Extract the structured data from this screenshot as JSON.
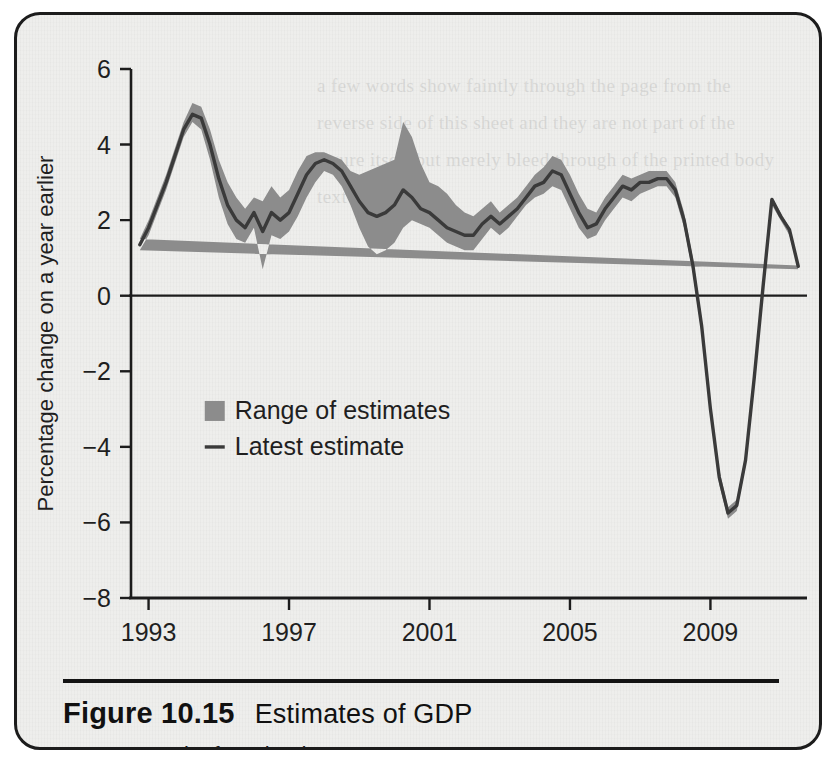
{
  "figure": {
    "number": "Figure 10.15",
    "title": "Estimates of GDP",
    "source_label": "Source:",
    "source_value": "Bank of England."
  },
  "colors": {
    "band": "#8c8c8c",
    "line": "#3a3a3a",
    "axis": "#1c1c1c",
    "paper": "#eeeeec",
    "border": "#1c1c1c"
  },
  "ghost_text": "a few words show faintly through the page from the reverse side of this sheet and they are not part of the figure itself but merely bleed through of the printed body text behind",
  "chart_data": {
    "type": "area",
    "title": "Estimates of GDP",
    "xlabel": "",
    "ylabel": "Percentage change on a year earlier",
    "xlim": [
      1992.5,
      2011.75
    ],
    "ylim": [
      -8,
      6
    ],
    "yticks": [
      6,
      4,
      2,
      0,
      -2,
      -4,
      -6,
      -8
    ],
    "ytick_labels": [
      "6",
      "4",
      "2",
      "0",
      "−2",
      "−4",
      "−6",
      "−8"
    ],
    "xticks": [
      1993,
      1997,
      2001,
      2005,
      2009
    ],
    "xtick_labels": [
      "1993",
      "1997",
      "2001",
      "2005",
      "2009"
    ],
    "grid": false,
    "zero_line": true,
    "legend": {
      "position": "inside-left",
      "entries": [
        {
          "label": "Range of estimates",
          "marker": "filled-square",
          "color": "#8c8c8c"
        },
        {
          "label": "Latest estimate",
          "marker": "line",
          "color": "#3a3a3a"
        }
      ]
    },
    "x": [
      1992.75,
      1993.0,
      1993.25,
      1993.5,
      1993.75,
      1994.0,
      1994.25,
      1994.5,
      1994.75,
      1995.0,
      1995.25,
      1995.5,
      1995.75,
      1996.0,
      1996.25,
      1996.5,
      1996.75,
      1997.0,
      1997.25,
      1997.5,
      1997.75,
      1998.0,
      1998.25,
      1998.5,
      1998.75,
      1999.0,
      1999.25,
      1999.5,
      1999.75,
      2000.0,
      2000.25,
      2000.5,
      2000.75,
      2001.0,
      2001.25,
      2001.5,
      2001.75,
      2002.0,
      2002.25,
      2002.5,
      2002.75,
      2003.0,
      2003.25,
      2003.5,
      2003.75,
      2004.0,
      2004.25,
      2004.5,
      2004.75,
      2005.0,
      2005.25,
      2005.5,
      2005.75,
      2006.0,
      2006.25,
      2006.5,
      2006.75,
      2007.0,
      2007.25,
      2007.5,
      2007.75,
      2008.0,
      2008.25,
      2008.5,
      2008.75,
      2009.0,
      2009.25,
      2009.5,
      2009.75,
      2010.0,
      2010.25,
      2010.5,
      2010.75,
      2011.0,
      2011.25,
      2011.5
    ],
    "series": [
      {
        "name": "Range of estimates (upper)",
        "role": "band-upper",
        "values": [
          1.5,
          2.0,
          2.6,
          3.2,
          3.9,
          4.6,
          5.1,
          5.0,
          4.4,
          3.6,
          3.0,
          2.6,
          2.3,
          2.6,
          2.5,
          2.9,
          2.6,
          2.8,
          3.3,
          3.7,
          3.8,
          3.8,
          3.7,
          3.6,
          3.3,
          3.2,
          3.3,
          3.4,
          3.5,
          3.6,
          4.6,
          4.2,
          3.5,
          3.0,
          2.9,
          2.7,
          2.4,
          2.2,
          2.1,
          2.3,
          2.5,
          2.2,
          2.4,
          2.6,
          2.9,
          3.2,
          3.4,
          3.7,
          3.6,
          3.2,
          2.7,
          2.3,
          2.2,
          2.6,
          2.9,
          3.2,
          3.1,
          3.2,
          3.3,
          3.3,
          3.3,
          3.0,
          2.2,
          1.0,
          -0.6,
          -2.8,
          -4.6,
          -5.6,
          -5.4,
          -4.2,
          -2.0,
          0.4,
          2.6,
          2.2,
          1.8,
          0.8
        ]
      },
      {
        "name": "Range of estimates (lower)",
        "role": "band-lower",
        "values": [
          1.2,
          1.6,
          2.2,
          2.8,
          3.5,
          4.2,
          4.6,
          4.4,
          3.6,
          2.6,
          1.9,
          1.5,
          1.4,
          1.8,
          0.7,
          1.6,
          1.5,
          1.7,
          2.1,
          2.6,
          3.0,
          3.3,
          3.2,
          2.9,
          2.4,
          1.8,
          1.3,
          1.1,
          1.2,
          1.4,
          1.8,
          2.0,
          1.9,
          1.8,
          1.6,
          1.4,
          1.3,
          1.2,
          1.2,
          1.5,
          1.8,
          1.6,
          1.8,
          2.1,
          2.4,
          2.6,
          2.7,
          2.9,
          2.8,
          2.3,
          1.8,
          1.5,
          1.6,
          2.0,
          2.3,
          2.6,
          2.5,
          2.7,
          2.8,
          2.9,
          2.9,
          2.6,
          1.8,
          0.6,
          -1.0,
          -3.2,
          -5.0,
          -5.9,
          -5.7,
          -4.5,
          -2.3,
          0.1,
          2.4,
          2.0,
          1.6,
          0.7
        ]
      },
      {
        "name": "Latest estimate",
        "role": "line",
        "values": [
          1.35,
          1.8,
          2.4,
          3.0,
          3.7,
          4.4,
          4.8,
          4.7,
          4.0,
          3.1,
          2.4,
          2.0,
          1.8,
          2.2,
          1.7,
          2.2,
          2.0,
          2.2,
          2.7,
          3.2,
          3.5,
          3.6,
          3.5,
          3.3,
          2.9,
          2.5,
          2.2,
          2.1,
          2.2,
          2.4,
          2.8,
          2.6,
          2.3,
          2.2,
          2.0,
          1.8,
          1.7,
          1.6,
          1.6,
          1.9,
          2.1,
          1.9,
          2.1,
          2.3,
          2.6,
          2.9,
          3.0,
          3.3,
          3.2,
          2.7,
          2.2,
          1.8,
          1.9,
          2.3,
          2.6,
          2.9,
          2.8,
          3.0,
          3.0,
          3.1,
          3.1,
          2.8,
          2.0,
          0.8,
          -0.8,
          -3.0,
          -4.8,
          -5.75,
          -5.55,
          -4.35,
          -2.15,
          0.25,
          2.55,
          2.1,
          1.75,
          0.78
        ]
      }
    ]
  }
}
